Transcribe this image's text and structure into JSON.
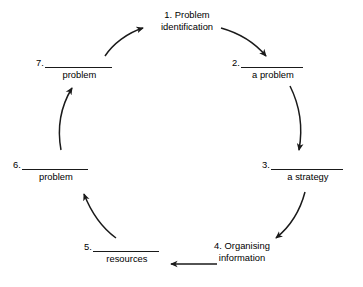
{
  "diagram": {
    "background_color": "#ffffff",
    "stroke_color": "#1a1a1a",
    "text_color": "#000000",
    "direction": "clockwise",
    "steps": [
      {
        "number": "1.",
        "style": "plain",
        "line1": "1. Problem",
        "line2": "identification",
        "blank": "",
        "caption": ""
      },
      {
        "number": "2.",
        "style": "blank",
        "line1": "",
        "line2": "",
        "blank": "__________",
        "caption": "a problem"
      },
      {
        "number": "3.",
        "style": "blank",
        "line1": "",
        "line2": "",
        "blank": "__________",
        "caption": "a strategy"
      },
      {
        "number": "4.",
        "style": "plain",
        "line1": "4. Organising",
        "line2": "information",
        "blank": "",
        "caption": ""
      },
      {
        "number": "5.",
        "style": "blank",
        "line1": "",
        "line2": "",
        "blank": "__________",
        "caption": "resources"
      },
      {
        "number": "6.",
        "style": "blank",
        "line1": "",
        "line2": "",
        "blank": "__________",
        "caption": "problem"
      },
      {
        "number": "7.",
        "style": "blank",
        "line1": "",
        "line2": "",
        "blank": "__________",
        "caption": "problem"
      }
    ],
    "connectors": [
      {
        "name": "arrow-7-to-1",
        "shape": "curve",
        "from": "7",
        "to": "1"
      },
      {
        "name": "arrow-1-to-2",
        "shape": "curve",
        "from": "1",
        "to": "2"
      },
      {
        "name": "arrow-2-to-3",
        "shape": "curve",
        "from": "2",
        "to": "3"
      },
      {
        "name": "arrow-3-to-4",
        "shape": "curve",
        "from": "3",
        "to": "4"
      },
      {
        "name": "arrow-4-to-5",
        "shape": "straight",
        "from": "4",
        "to": "5"
      },
      {
        "name": "arrow-5-to-6",
        "shape": "curve",
        "from": "5",
        "to": "6"
      },
      {
        "name": "arrow-6-to-7",
        "shape": "curve",
        "from": "6",
        "to": "7"
      }
    ]
  }
}
